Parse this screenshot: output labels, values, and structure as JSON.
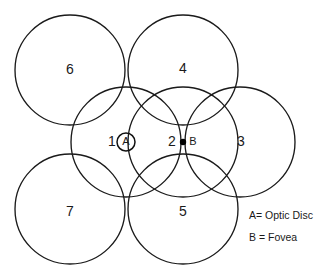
{
  "figure": {
    "name": "retina-sector-diagram",
    "background_color": "#ffffff",
    "stroke_color": "#1a1a1a",
    "width": 333,
    "height": 279
  },
  "sectors": [
    {
      "id": "sector-1",
      "label": "1",
      "cx": 126,
      "cy": 142,
      "r": 55,
      "label_x": 112,
      "label_y": 142
    },
    {
      "id": "sector-2",
      "label": "2",
      "cx": 183,
      "cy": 142,
      "r": 55,
      "label_x": 172,
      "label_y": 142
    },
    {
      "id": "sector-3",
      "label": "3",
      "cx": 240,
      "cy": 142,
      "r": 55,
      "label_x": 241,
      "label_y": 142
    },
    {
      "id": "sector-4",
      "label": "4",
      "cx": 183,
      "cy": 70,
      "r": 55,
      "label_x": 183,
      "label_y": 69
    },
    {
      "id": "sector-5",
      "label": "5",
      "cx": 183,
      "cy": 209,
      "r": 55,
      "label_x": 183,
      "label_y": 212
    },
    {
      "id": "sector-6",
      "label": "6",
      "cx": 70,
      "cy": 70,
      "r": 55,
      "label_x": 70,
      "label_y": 70
    },
    {
      "id": "sector-7",
      "label": "7",
      "cx": 70,
      "cy": 209,
      "r": 55,
      "label_x": 70,
      "label_y": 212
    }
  ],
  "markers": [
    {
      "id": "marker-a",
      "index": "1",
      "letter": "A",
      "shape": "ring",
      "cx": 126,
      "cy": 142,
      "r": 9,
      "index_x": 112,
      "index_y": 142,
      "letter_x": 126,
      "letter_y": 142
    },
    {
      "id": "marker-b",
      "index": "2",
      "letter": "B",
      "shape": "dot",
      "cx": 183,
      "cy": 142,
      "r": 3.2,
      "index_x": 172,
      "index_y": 142,
      "letter_x": 193,
      "letter_y": 142
    }
  ],
  "legend": {
    "items": [
      {
        "id": "legend-optic-disc",
        "text": "A= Optic Disc",
        "x": 249,
        "y": 216
      },
      {
        "id": "legend-fovea",
        "text": "B = Fovea",
        "x": 249,
        "y": 238
      }
    ]
  }
}
